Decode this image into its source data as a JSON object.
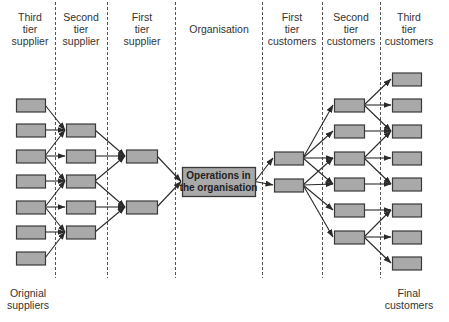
{
  "columns": [
    {
      "id": "third-tier-supplier",
      "header": "Third\ntier\nsupplier",
      "x": 30
    },
    {
      "id": "second-tier-supplier",
      "header": "Second\ntier\nsupplier",
      "x": 81
    },
    {
      "id": "first-tier-supplier",
      "header": "First\ntier\nsupplier",
      "x": 142
    },
    {
      "id": "organisation",
      "header": "Organisation",
      "x": 218
    },
    {
      "id": "first-tier-customers",
      "header": "First\ntier\ncustomers",
      "x": 290
    },
    {
      "id": "second-tier-customers",
      "header": "Second\ntier\ncustomers",
      "x": 350
    },
    {
      "id": "third-tier-customers",
      "header": "Third\ntier\ncustomers",
      "x": 408
    }
  ],
  "footers": {
    "left": "Orignial\nsuppliers",
    "right": "Final\ncustomers"
  },
  "center_box": {
    "line1": "Operations in",
    "line2": "the organisation"
  },
  "dividers_x": [
    55,
    107,
    175,
    262,
    322,
    380
  ],
  "colors": {
    "box_fill": "#a9a9a9",
    "box_border": "#3a3a3a",
    "arrow": "#2a2a2a",
    "divider": "#555555",
    "text": "#333333"
  },
  "nodes": {
    "s3": {
      "x": 16,
      "w": 29,
      "h": 13,
      "ys": [
        105,
        130,
        156,
        181,
        207,
        232,
        258
      ]
    },
    "s2": {
      "x": 66,
      "w": 29,
      "h": 13,
      "ys": [
        130,
        156,
        181,
        207,
        232
      ]
    },
    "s1": {
      "x": 126,
      "w": 31,
      "h": 13,
      "ys": [
        156,
        207
      ]
    },
    "org": {
      "x": 182,
      "y": 167,
      "w": 73,
      "h": 29
    },
    "c1": {
      "x": 274,
      "w": 29,
      "h": 13,
      "ys": [
        158,
        185
      ]
    },
    "c2": {
      "x": 334,
      "w": 30,
      "h": 13,
      "ys": [
        105,
        131,
        158,
        184,
        210,
        237
      ]
    },
    "c3": {
      "x": 392,
      "w": 29,
      "h": 13,
      "ys": [
        79,
        105,
        131,
        158,
        184,
        210,
        237,
        263
      ]
    }
  },
  "edges": [
    [
      "s3",
      0,
      "s2",
      0
    ],
    [
      "s3",
      1,
      "s2",
      0
    ],
    [
      "s3",
      2,
      "s2",
      0
    ],
    [
      "s3",
      2,
      "s2",
      1
    ],
    [
      "s3",
      2,
      "s2",
      2
    ],
    [
      "s3",
      3,
      "s2",
      2
    ],
    [
      "s3",
      4,
      "s2",
      2
    ],
    [
      "s3",
      4,
      "s2",
      3
    ],
    [
      "s3",
      4,
      "s2",
      4
    ],
    [
      "s3",
      5,
      "s2",
      4
    ],
    [
      "s3",
      6,
      "s2",
      4
    ],
    [
      "s2",
      0,
      "s1",
      0
    ],
    [
      "s2",
      1,
      "s1",
      0
    ],
    [
      "s2",
      2,
      "s1",
      0
    ],
    [
      "s2",
      2,
      "s1",
      1
    ],
    [
      "s2",
      3,
      "s1",
      1
    ],
    [
      "s2",
      4,
      "s1",
      1
    ],
    [
      "s1",
      0,
      "org",
      0
    ],
    [
      "s1",
      1,
      "org",
      0
    ],
    [
      "org",
      0,
      "c1",
      0
    ],
    [
      "org",
      0,
      "c1",
      1
    ],
    [
      "c1",
      0,
      "c2",
      0
    ],
    [
      "c1",
      0,
      "c2",
      1
    ],
    [
      "c1",
      0,
      "c2",
      2
    ],
    [
      "c1",
      0,
      "c2",
      3
    ],
    [
      "c1",
      1,
      "c2",
      2
    ],
    [
      "c1",
      1,
      "c2",
      3
    ],
    [
      "c1",
      1,
      "c2",
      4
    ],
    [
      "c1",
      1,
      "c2",
      5
    ],
    [
      "c2",
      0,
      "c3",
      0
    ],
    [
      "c2",
      0,
      "c3",
      1
    ],
    [
      "c2",
      0,
      "c3",
      2
    ],
    [
      "c2",
      1,
      "c3",
      2
    ],
    [
      "c2",
      2,
      "c3",
      2
    ],
    [
      "c2",
      2,
      "c3",
      3
    ],
    [
      "c2",
      2,
      "c3",
      4
    ],
    [
      "c2",
      3,
      "c3",
      4
    ],
    [
      "c2",
      4,
      "c3",
      5
    ],
    [
      "c2",
      5,
      "c3",
      5
    ],
    [
      "c2",
      5,
      "c3",
      6
    ],
    [
      "c2",
      5,
      "c3",
      7
    ]
  ]
}
